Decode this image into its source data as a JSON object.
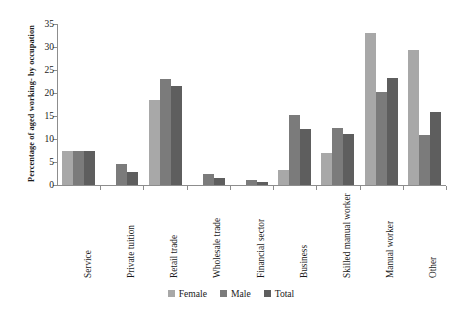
{
  "chart_data": {
    "type": "bar",
    "title": "",
    "xlabel": "",
    "ylabel": "Percentage of aged working- by occupation",
    "ylim": [
      0,
      35
    ],
    "yticks": [
      0,
      5,
      10,
      15,
      20,
      25,
      30,
      35
    ],
    "grid": false,
    "legend_position": "bottom",
    "categories": [
      "Service",
      "Private tuition",
      "Retail trade",
      "Wholesale trade",
      "Financial sector",
      "Business",
      "Skilled manual worker",
      "Manual worker",
      "Other"
    ],
    "series": [
      {
        "name": "Female",
        "color": "#a8a8a8",
        "values": [
          7.3,
          0,
          18.4,
          0,
          0,
          3.2,
          7.0,
          33.0,
          29.3
        ]
      },
      {
        "name": "Male",
        "color": "#7b7b7b",
        "values": [
          7.4,
          4.5,
          23.0,
          2.3,
          1.0,
          15.3,
          12.5,
          20.2,
          10.8
        ]
      },
      {
        "name": "Total",
        "color": "#5e5e5e",
        "values": [
          7.3,
          2.8,
          21.6,
          1.5,
          0.7,
          12.2,
          11.1,
          23.3,
          15.8
        ]
      }
    ]
  },
  "colors": {
    "female": "#a8a8a8",
    "male": "#7b7b7b",
    "total": "#5e5e5e",
    "axis": "#8d8d8d",
    "text": "#1a1a1a",
    "background": "#ffffff"
  }
}
